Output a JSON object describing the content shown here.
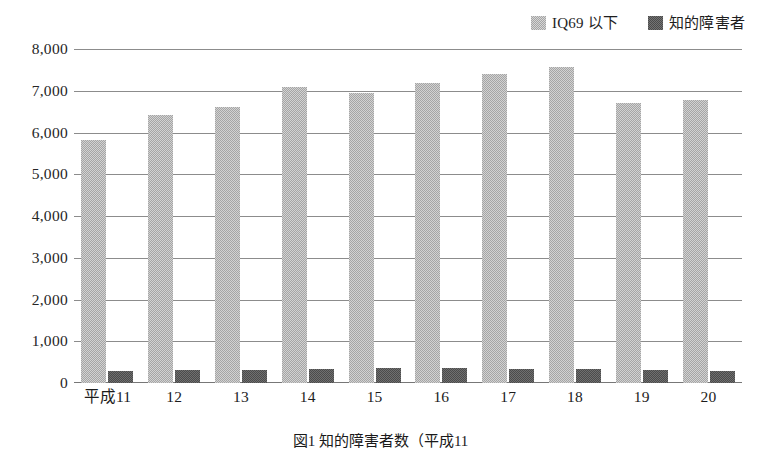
{
  "chart_data": {
    "type": "bar",
    "title": "",
    "xlabel": "",
    "ylabel": "",
    "ylim": [
      0,
      8000
    ],
    "ytick_step": 1000,
    "grid": true,
    "legend_position": "top-right",
    "categories": [
      "平成11",
      "12",
      "13",
      "14",
      "15",
      "16",
      "17",
      "18",
      "19",
      "20"
    ],
    "ytick_labels": [
      "8,000",
      "7,000",
      "6,000",
      "5,000",
      "4,000",
      "3,000",
      "2,000",
      "1,000",
      "0"
    ],
    "ytick_values": [
      8000,
      7000,
      6000,
      5000,
      4000,
      3000,
      2000,
      1000,
      0
    ],
    "series": [
      {
        "name": "IQ69 以下",
        "color": "#a5a5a5",
        "values": [
          5830,
          6410,
          6610,
          7090,
          6940,
          7190,
          7390,
          7570,
          6710,
          6780
        ]
      },
      {
        "name": "知的障害者",
        "color": "#4b4b4b",
        "values": [
          290,
          310,
          300,
          340,
          370,
          350,
          340,
          340,
          300,
          290
        ]
      }
    ]
  },
  "legend": {
    "entries": [
      {
        "label": "IQ69 以下",
        "swatch": "light-gray-swatch-icon"
      },
      {
        "label": "知的障害者",
        "swatch": "dark-gray-swatch-icon"
      }
    ]
  },
  "caption": {
    "text": "図1  知的障害者数（平成11"
  }
}
